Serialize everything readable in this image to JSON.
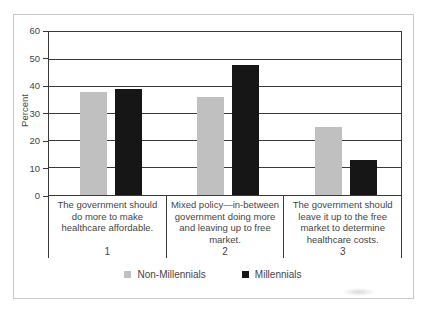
{
  "chart_data": {
    "type": "bar",
    "title": "",
    "xlabel": "",
    "ylabel": "Percent",
    "ylim": [
      0,
      60
    ],
    "yticks": [
      0,
      10,
      20,
      30,
      40,
      50,
      60
    ],
    "grid": true,
    "legend_position": "bottom",
    "categories": [
      {
        "number": "1",
        "label": "The government should do more to make healthcare affordable."
      },
      {
        "number": "2",
        "label": "Mixed policy—in-between government doing more and leaving up to free market."
      },
      {
        "number": "3",
        "label": "The government should leave it up to the free market to determine healthcare costs."
      }
    ],
    "series": [
      {
        "name": "Non-Millennials",
        "color": "#c0c0c0",
        "values": [
          38,
          36,
          25
        ]
      },
      {
        "name": "Millennials",
        "color": "#161616",
        "values": [
          39,
          48,
          13
        ]
      }
    ]
  },
  "colors": {
    "axis": "#3a3a3a",
    "grid": "#3a3a3a",
    "text": "#454545",
    "frame": "#c9c9c9"
  }
}
